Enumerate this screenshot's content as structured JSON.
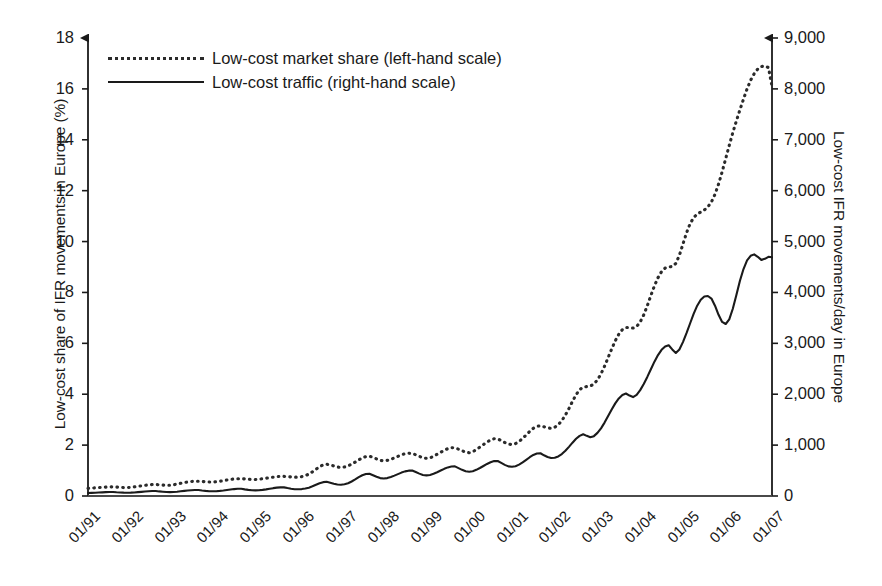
{
  "chart_data": {
    "type": "line",
    "title": "",
    "subtitle": "",
    "xlabel": "",
    "ylabel": "Low-cost share of IFR movements in Europe (%)",
    "y2label": "Low-cost IFR movements/day in Europe",
    "grid": false,
    "legend_position": "top-left",
    "xlim": [
      "01/91",
      "01/07"
    ],
    "ylim": [
      0,
      18
    ],
    "y2lim": [
      0,
      9000
    ],
    "x_tick_labels": [
      "01/91",
      "01/92",
      "01/93",
      "01/94",
      "01/95",
      "01/96",
      "01/97",
      "01/98",
      "01/99",
      "01/00",
      "01/01",
      "01/02",
      "01/03",
      "01/04",
      "01/05",
      "01/06",
      "01/07"
    ],
    "y_tick_labels": [
      "0",
      "2",
      "4",
      "6",
      "8",
      "10",
      "12",
      "14",
      "16",
      "18"
    ],
    "y2_tick_labels": [
      "0",
      "1,000",
      "2,000",
      "3,000",
      "4,000",
      "5,000",
      "6,000",
      "7,000",
      "8,000",
      "9,000"
    ],
    "series": [
      {
        "name": "Low-cost market share (left-hand scale)",
        "axis": "left",
        "style": "dotted",
        "color": "#2b2b2b",
        "unit": "%",
        "x_start": "01/91",
        "x_step_months": 1,
        "values": [
          0.3,
          0.31,
          0.32,
          0.33,
          0.34,
          0.35,
          0.36,
          0.36,
          0.35,
          0.34,
          0.33,
          0.33,
          0.34,
          0.36,
          0.38,
          0.4,
          0.42,
          0.44,
          0.45,
          0.45,
          0.44,
          0.43,
          0.42,
          0.42,
          0.44,
          0.47,
          0.5,
          0.53,
          0.55,
          0.57,
          0.58,
          0.58,
          0.57,
          0.56,
          0.55,
          0.55,
          0.56,
          0.58,
          0.6,
          0.63,
          0.65,
          0.67,
          0.68,
          0.68,
          0.67,
          0.66,
          0.65,
          0.65,
          0.66,
          0.68,
          0.7,
          0.72,
          0.74,
          0.76,
          0.77,
          0.77,
          0.76,
          0.75,
          0.74,
          0.74,
          0.76,
          0.8,
          0.86,
          0.95,
          1.05,
          1.15,
          1.22,
          1.25,
          1.22,
          1.18,
          1.14,
          1.12,
          1.14,
          1.18,
          1.25,
          1.33,
          1.42,
          1.5,
          1.55,
          1.56,
          1.52,
          1.46,
          1.4,
          1.38,
          1.4,
          1.44,
          1.5,
          1.56,
          1.62,
          1.66,
          1.68,
          1.67,
          1.62,
          1.56,
          1.5,
          1.48,
          1.5,
          1.56,
          1.64,
          1.72,
          1.8,
          1.86,
          1.9,
          1.89,
          1.84,
          1.78,
          1.72,
          1.7,
          1.74,
          1.82,
          1.92,
          2.02,
          2.12,
          2.2,
          2.25,
          2.24,
          2.18,
          2.1,
          2.04,
          2.02,
          2.06,
          2.14,
          2.26,
          2.4,
          2.54,
          2.66,
          2.74,
          2.76,
          2.72,
          2.68,
          2.66,
          2.7,
          2.8,
          2.96,
          3.18,
          3.44,
          3.72,
          3.98,
          4.18,
          4.28,
          4.3,
          4.32,
          4.4,
          4.56,
          4.8,
          5.1,
          5.44,
          5.78,
          6.1,
          6.36,
          6.54,
          6.62,
          6.62,
          6.6,
          6.66,
          6.84,
          7.12,
          7.48,
          7.88,
          8.26,
          8.58,
          8.82,
          8.96,
          9.0,
          9.02,
          9.14,
          9.46,
          9.9,
          10.34,
          10.7,
          10.94,
          11.08,
          11.16,
          11.24,
          11.36,
          11.56,
          11.86,
          12.26,
          12.74,
          13.26,
          13.78,
          14.28,
          14.74,
          15.18,
          15.6,
          16.0,
          16.34,
          16.6,
          16.78,
          16.88,
          16.9,
          16.84,
          16.1
        ]
      },
      {
        "name": "Low-cost traffic (right-hand scale)",
        "axis": "right",
        "style": "solid",
        "color": "#1a1a1a",
        "unit": "movements/day",
        "x_start": "01/91",
        "x_step_months": 1,
        "values": [
          60,
          62,
          65,
          68,
          72,
          76,
          80,
          80,
          74,
          70,
          66,
          64,
          66,
          70,
          76,
          82,
          88,
          94,
          98,
          98,
          90,
          84,
          78,
          76,
          78,
          84,
          92,
          100,
          108,
          114,
          118,
          118,
          108,
          100,
          94,
          92,
          94,
          100,
          108,
          118,
          128,
          136,
          142,
          142,
          130,
          120,
          112,
          110,
          112,
          120,
          130,
          142,
          154,
          164,
          170,
          170,
          156,
          144,
          134,
          132,
          136,
          146,
          164,
          190,
          220,
          250,
          272,
          280,
          262,
          242,
          226,
          220,
          230,
          250,
          285,
          325,
          370,
          408,
          432,
          438,
          408,
          378,
          352,
          344,
          352,
          372,
          400,
          430,
          460,
          484,
          498,
          500,
          470,
          440,
          414,
          406,
          414,
          436,
          466,
          500,
          534,
          562,
          580,
          582,
          548,
          514,
          486,
          478,
          488,
          514,
          550,
          590,
          630,
          664,
          686,
          688,
          650,
          612,
          582,
          574,
          586,
          616,
          660,
          710,
          762,
          806,
          834,
          840,
          800,
          766,
          746,
          752,
          778,
          824,
          890,
          966,
          1048,
          1124,
          1182,
          1212,
          1182,
          1156,
          1176,
          1240,
          1330,
          1442,
          1570,
          1700,
          1820,
          1918,
          1986,
          2014,
          1974,
          1944,
          1986,
          2080,
          2200,
          2340,
          2490,
          2640,
          2770,
          2872,
          2938,
          2962,
          2880,
          2810,
          2880,
          3024,
          3200,
          3390,
          3580,
          3740,
          3856,
          3920,
          3930,
          3880,
          3740,
          3560,
          3420,
          3380,
          3470,
          3680,
          3950,
          4230,
          4460,
          4630,
          4720,
          4748,
          4700,
          4640,
          4660,
          4700,
          4690
        ]
      }
    ]
  },
  "legend": {
    "items": [
      {
        "label": "Low-cost market share (left-hand scale)",
        "style": "dotted"
      },
      {
        "label": "Low-cost traffic (right-hand scale)",
        "style": "solid"
      }
    ]
  },
  "axes": {
    "left": {
      "title": "Low-cost share of IFR movements in Europe (%)",
      "ticks": [
        "18",
        "16",
        "14",
        "12",
        "10",
        "8",
        "6",
        "4",
        "2",
        "0"
      ]
    },
    "right": {
      "title": "Low-cost IFR movements/day in Europe",
      "ticks": [
        "9,000",
        "8,000",
        "7,000",
        "6,000",
        "5,000",
        "4,000",
        "3,000",
        "2,000",
        "1,000",
        "0"
      ]
    },
    "bottom": {
      "ticks": [
        "01/91",
        "01/92",
        "01/93",
        "01/94",
        "01/95",
        "01/96",
        "01/97",
        "01/98",
        "01/99",
        "01/00",
        "01/01",
        "01/02",
        "01/03",
        "01/04",
        "01/05",
        "01/06",
        "01/07"
      ]
    }
  }
}
